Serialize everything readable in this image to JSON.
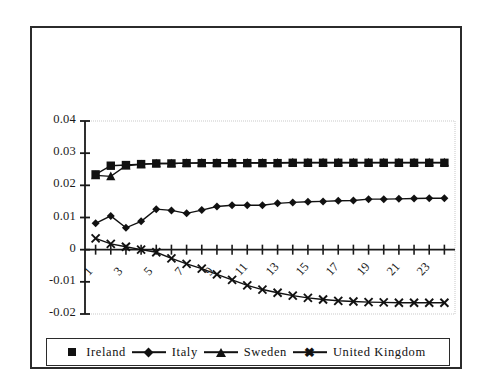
{
  "chart_data": {
    "type": "line",
    "title": "",
    "xlabel": "",
    "ylabel": "",
    "x": [
      1,
      2,
      3,
      4,
      5,
      6,
      7,
      8,
      9,
      10,
      11,
      12,
      13,
      14,
      15,
      16,
      17,
      18,
      19,
      20,
      21,
      22,
      23,
      24
    ],
    "xtick_labels": [
      "1",
      "3",
      "5",
      "7",
      "9",
      "11",
      "13",
      "15",
      "17",
      "19",
      "21",
      "23"
    ],
    "xtick_values": [
      1,
      3,
      5,
      7,
      9,
      11,
      13,
      15,
      17,
      19,
      21,
      23
    ],
    "ytick_labels": [
      "0.04",
      "0.03",
      "0.02",
      "0.01",
      "0",
      "-0.01",
      "-0.02"
    ],
    "ytick_values": [
      0.04,
      0.03,
      0.02,
      0.01,
      0,
      -0.01,
      -0.02
    ],
    "ylim": [
      -0.02,
      0.04
    ],
    "xlim": [
      0.3,
      24.7
    ],
    "grid": false,
    "legend_position": "bottom",
    "series": [
      {
        "name": "Ireland",
        "marker": "square",
        "color": "#111111",
        "values": [
          0.0234,
          0.0261,
          0.0263,
          0.0266,
          0.0268,
          0.0268,
          0.0269,
          0.0269,
          0.0269,
          0.0269,
          0.0269,
          0.0269,
          0.0269,
          0.027,
          0.027,
          0.027,
          0.027,
          0.027,
          0.027,
          0.027,
          0.027,
          0.027,
          0.027,
          0.027
        ]
      },
      {
        "name": "Italy",
        "marker": "diamond",
        "color": "#111111",
        "values": [
          0.0082,
          0.0105,
          0.0068,
          0.0088,
          0.0126,
          0.0122,
          0.0113,
          0.0123,
          0.0134,
          0.0138,
          0.0138,
          0.0138,
          0.0144,
          0.0147,
          0.0149,
          0.015,
          0.0152,
          0.0153,
          0.0157,
          0.0157,
          0.0158,
          0.0159,
          0.016,
          0.016
        ]
      },
      {
        "name": "Sweden",
        "marker": "triangle",
        "color": "#111111",
        "values": [
          0.0231,
          0.0228,
          0.0261,
          0.0265,
          0.0268,
          0.0268,
          0.0269,
          0.027,
          0.027,
          0.027,
          0.027,
          0.027,
          0.027,
          0.0271,
          0.0271,
          0.0271,
          0.0271,
          0.0271,
          0.0271,
          0.0271,
          0.0271,
          0.0271,
          0.0271,
          0.0271
        ]
      },
      {
        "name": "United Kingdom",
        "marker": "x",
        "color": "#111111",
        "values": [
          0.0035,
          0.0018,
          0.0009,
          0.0,
          -0.0008,
          -0.0027,
          -0.0044,
          -0.0059,
          -0.0077,
          -0.0094,
          -0.0111,
          -0.0124,
          -0.0134,
          -0.0143,
          -0.015,
          -0.0155,
          -0.0159,
          -0.0161,
          -0.0163,
          -0.0164,
          -0.0165,
          -0.0165,
          -0.0165,
          -0.0165
        ]
      }
    ]
  },
  "legend": {
    "items": [
      {
        "label": "Ireland",
        "marker": "square",
        "show_line": false
      },
      {
        "label": "Italy",
        "marker": "diamond",
        "show_line": true
      },
      {
        "label": "Sweden",
        "marker": "triangle",
        "show_line": true
      },
      {
        "label": "United Kingdom",
        "marker": "x",
        "show_line": true
      }
    ]
  },
  "colors": {
    "frame": "#2b2b2b",
    "axis": "#1a1a1a",
    "series": "#111111",
    "background": "#ffffff"
  }
}
